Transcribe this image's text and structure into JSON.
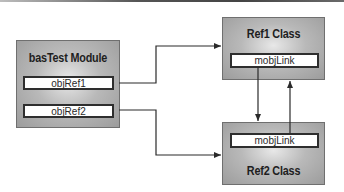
{
  "diagram": {
    "module": {
      "title": "basTest Module",
      "fields": [
        {
          "label": "objRef1"
        },
        {
          "label": "objRef2"
        }
      ]
    },
    "ref1": {
      "title": "Ref1 Class",
      "field": {
        "label": "mobjLink"
      }
    },
    "ref2": {
      "title": "Ref2 Class",
      "field": {
        "label": "mobjLink"
      }
    },
    "connections": [
      {
        "from": "objRef1",
        "to": "Ref1 Class"
      },
      {
        "from": "objRef2",
        "to": "Ref2 Class"
      },
      {
        "from": "Ref1 Class.mobjLink",
        "to": "Ref2 Class"
      },
      {
        "from": "Ref2 Class.mobjLink",
        "to": "Ref1 Class"
      }
    ],
    "colors": {
      "line": "#2a2a2a",
      "box_fill": "#b9b9b9",
      "field_fill": "#ffffff"
    }
  }
}
